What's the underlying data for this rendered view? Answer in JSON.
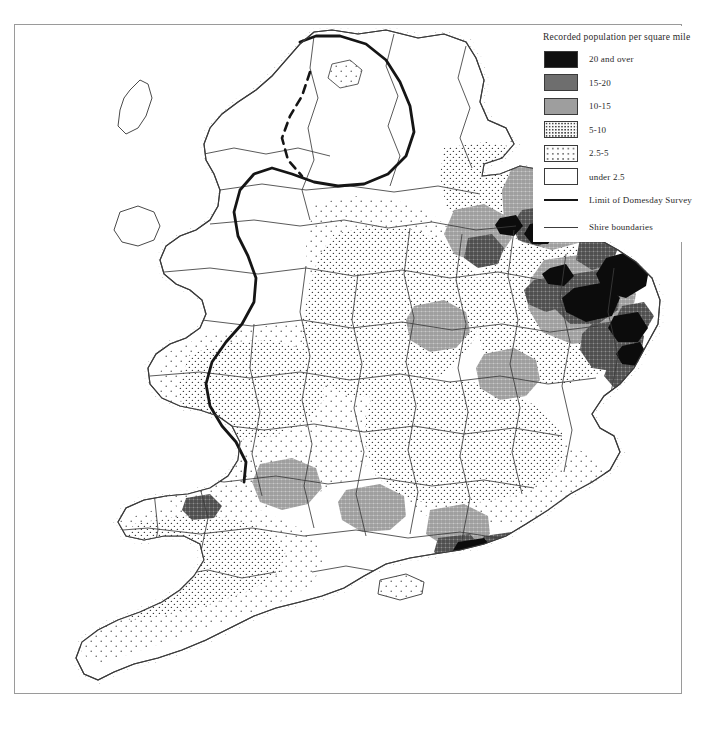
{
  "figure": {
    "kind": "thematic-map",
    "frame": {
      "border_color": "#9a9a9a"
    }
  },
  "legend": {
    "title": "Recorded population per square mile",
    "classes": [
      {
        "label": "20 and over",
        "swatch": "solid-black",
        "color": "#101010"
      },
      {
        "label": "15-20",
        "swatch": "solid-dark-gray",
        "color": "#6e6e6e"
      },
      {
        "label": "10-15",
        "swatch": "solid-mid-gray",
        "color": "#9e9e9e"
      },
      {
        "label": "5-10",
        "swatch": "dense-stipple",
        "color": "#fafafa"
      },
      {
        "label": "2.5-5",
        "swatch": "sparse-stipple",
        "color": "#fdfdfd"
      },
      {
        "label": "under 2.5",
        "swatch": "blank-white",
        "color": "#ffffff"
      }
    ],
    "lines": [
      {
        "label": "Limit of Domesday Survey",
        "style": "thick",
        "color": "#151515"
      },
      {
        "label": "Shire boundaries",
        "style": "thin",
        "color": "#3c3c3c"
      }
    ]
  },
  "map": {
    "coastline_color": "#4a4a4a",
    "shire_boundary_color": "#3c3c3c",
    "survey_limit_color": "#151515",
    "islands": [
      "isle-of-man",
      "anglesey",
      "isle-of-wight"
    ],
    "regions_high_density": [
      "east-anglia",
      "lincolnshire",
      "sussex-coast",
      "kent"
    ],
    "regions_low_density": [
      "northern-england",
      "wales",
      "pennines"
    ]
  }
}
